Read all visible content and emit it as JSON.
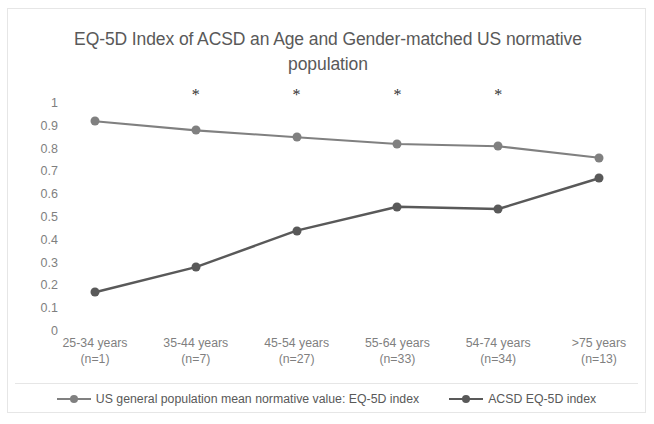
{
  "chart_data": {
    "type": "line",
    "title": "EQ-5D Index of ACSD an Age and Gender-matched US normative population",
    "title_line1": "EQ-5D Index of ACSD an Age and Gender-matched US",
    "title_line2": "normative population",
    "xlabel": "",
    "ylabel": "",
    "ylim": [
      0,
      1
    ],
    "ytick_labels": [
      "1",
      "0.9",
      "0.8",
      "0.7",
      "0.6",
      "0.5",
      "0.4",
      "0.3",
      "0.2",
      "0.1",
      "0"
    ],
    "ytick_values": [
      1,
      0.9,
      0.8,
      0.7,
      0.6,
      0.5,
      0.4,
      0.3,
      0.2,
      0.1,
      0
    ],
    "grid": false,
    "legend_position": "bottom",
    "categories": [
      "25-34 years\n(n=1)",
      "35-44 years\n(n=7)",
      "45-54 years\n(n=27)",
      "55-64 years\n(n=33)",
      "54-74 years\n(n=34)",
      ">75 years\n(n=13)"
    ],
    "category_lines": [
      {
        "range": "25-34 years",
        "n": "(n=1)"
      },
      {
        "range": "35-44 years",
        "n": "(n=7)"
      },
      {
        "range": "45-54 years",
        "n": "(n=27)"
      },
      {
        "range": "55-64 years",
        "n": "(n=33)"
      },
      {
        "range": "54-74 years",
        "n": "(n=34)"
      },
      {
        "range": ">75 years",
        "n": "(n=13)"
      }
    ],
    "series": [
      {
        "name": "US general population mean normative value: EQ-5D index",
        "color": "#808080",
        "values": [
          0.92,
          0.88,
          0.85,
          0.82,
          0.81,
          0.76
        ]
      },
      {
        "name": "ACSD EQ-5D index",
        "color": "#595959",
        "values": [
          0.17,
          0.28,
          0.44,
          0.545,
          0.535,
          0.67
        ]
      }
    ],
    "annotations": [
      {
        "symbol": "*",
        "category_index": 1,
        "y": 1.0
      },
      {
        "symbol": "*",
        "category_index": 2,
        "y": 1.0
      },
      {
        "symbol": "*",
        "category_index": 3,
        "y": 1.0
      },
      {
        "symbol": "*",
        "category_index": 4,
        "y": 1.0
      }
    ]
  },
  "colors": {
    "border": "#e6e6e6",
    "text": "#595959",
    "tick_text": "#7f7f7f",
    "series_us": "#808080",
    "series_acsd": "#595959"
  }
}
